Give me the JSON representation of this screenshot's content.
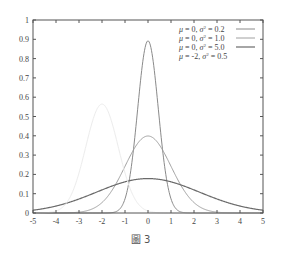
{
  "chart_data": {
    "type": "line",
    "title": "",
    "xlabel": "",
    "ylabel": "",
    "xlim": [
      -5,
      5
    ],
    "ylim": [
      0,
      1
    ],
    "grid": false,
    "legend_position": "top-right",
    "x_ticks": [
      "-5",
      "-4",
      "-3",
      "-2",
      "-1",
      "0",
      "1",
      "2",
      "3",
      "4",
      "5"
    ],
    "y_ticks": [
      "0",
      "0.1",
      "0.2",
      "0.3",
      "0.4",
      "0.5",
      "0.6",
      "0.7",
      "0.8",
      "0.9",
      "1"
    ],
    "series": [
      {
        "name": "μ = 0, σ² = 0.2",
        "mu": 0,
        "variance": 0.2,
        "color": "#8a8a8a",
        "width": 1.0,
        "peak": 0.89
      },
      {
        "name": "μ = 0, σ² = 1.0",
        "mu": 0,
        "variance": 1.0,
        "color": "#a0a0a0",
        "width": 1.0,
        "peak": 0.4
      },
      {
        "name": "μ = 0, σ² = 5.0",
        "mu": 0,
        "variance": 5.0,
        "color": "#6a6a6a",
        "width": 1.2,
        "peak": 0.18
      },
      {
        "name": "μ = -2, σ² = 0.5",
        "mu": -2,
        "variance": 0.5,
        "color": "#ececec",
        "width": 1.0,
        "peak": 0.56
      }
    ]
  },
  "legend": {
    "items": [
      {
        "mu_text": "μ = 0, ",
        "sigma_text": "σ",
        "sup": "2",
        "rest": " = 0.2"
      },
      {
        "mu_text": "μ = 0, ",
        "sigma_text": "σ",
        "sup": "2",
        "rest": " = 1.0"
      },
      {
        "mu_text": "μ = 0, ",
        "sigma_text": "σ",
        "sup": "2",
        "rest": " = 5.0"
      },
      {
        "mu_text": "μ = -2, ",
        "sigma_text": "σ",
        "sup": "2",
        "rest": " = 0.5"
      }
    ]
  },
  "caption": "圖 3"
}
